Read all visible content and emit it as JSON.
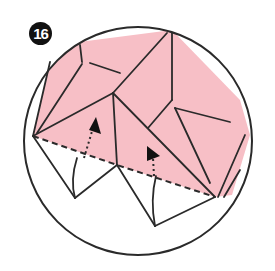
{
  "step": {
    "number": "16"
  },
  "colors": {
    "paper_front": "#f7bfc6",
    "paper_back": "#ffffff",
    "line": "#2a2a2a",
    "badge": "#111111"
  },
  "diagram": {
    "arrows": [
      {
        "type": "dotted-fold-up",
        "from": [
          83,
          160
        ],
        "to": [
          96,
          122
        ]
      },
      {
        "type": "dotted-fold-up",
        "from": [
          155,
          175
        ],
        "to": [
          150,
          148
        ]
      }
    ],
    "fold_lines": [
      {
        "type": "valley-dashed",
        "from": [
          33,
          136
        ],
        "to": [
          117,
          165
        ]
      },
      {
        "type": "valley-dashed",
        "from": [
          117,
          165
        ],
        "to": [
          215,
          197
        ]
      }
    ]
  }
}
